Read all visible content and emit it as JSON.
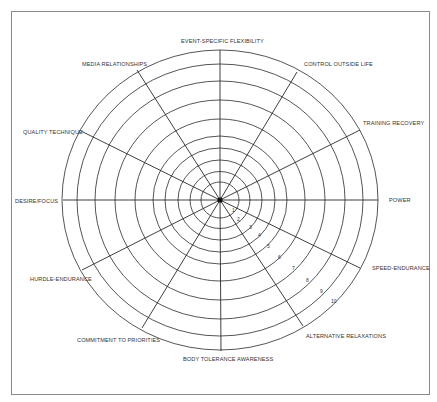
{
  "diagram": {
    "type": "wheel",
    "center": {
      "x": 220,
      "y": 200
    },
    "rings": {
      "count": 10,
      "rx": [
        19,
        30,
        42,
        55,
        67,
        85,
        105,
        125,
        143,
        158
      ],
      "ry": [
        18,
        28.5,
        40,
        52,
        64,
        81,
        100,
        119,
        136,
        150
      ]
    },
    "ring_labels": [
      "1",
      "2",
      "3",
      "4",
      "5",
      "6",
      "7",
      "8",
      "9",
      "10"
    ],
    "spokes": [
      {
        "label": "EVENT-SPECIFIC FLEXIBILITY",
        "end": [
          220,
          50
        ]
      },
      {
        "label": "CONTROL OUTSIDE LIFE",
        "end": [
          297,
          72
        ]
      },
      {
        "label": "TRAINING RECOVERY",
        "end": [
          360,
          130
        ]
      },
      {
        "label": "POWER",
        "end": [
          378,
          200
        ]
      },
      {
        "label": "SPEED-ENDURANCE",
        "end": [
          360,
          268
        ]
      },
      {
        "label": "ALTERNATIVE RELAXATIONS",
        "end": [
          303,
          326
        ]
      },
      {
        "label": "BODY TOLERANCE AWARENESS",
        "end": [
          221,
          351
        ]
      },
      {
        "label": "COMMITMENT TO PRIORITIES",
        "end": [
          142,
          328
        ]
      },
      {
        "label": "HURDLE-ENDURANCE",
        "end": [
          82,
          270
        ]
      },
      {
        "label": "DESIRE/FOCUS",
        "end": [
          63,
          200
        ]
      },
      {
        "label": "QUALITY TECHNIQUE",
        "end": [
          81,
          131
        ]
      },
      {
        "label": "MEDIA RELATIONSHIPS",
        "end": [
          137,
          70
        ]
      }
    ],
    "line_color": "#2a2a2a",
    "border_color": "#8a8a8a"
  }
}
